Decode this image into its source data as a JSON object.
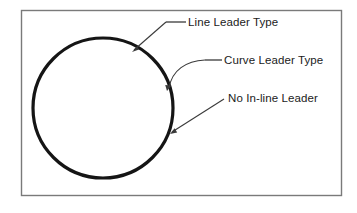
{
  "figure": {
    "name": "leader-type-diagram",
    "background_color": "#ffffff",
    "frame": {
      "name": "diagram-border",
      "stroke_color": "#7a7a7a",
      "x": 21,
      "y": 10,
      "width": 320,
      "height": 185
    },
    "shape": {
      "name": "circle",
      "stroke_color": "#151515",
      "fill": "none",
      "center_x": 103,
      "center_y": 108,
      "radius": 70,
      "stroke_width": 3.2
    },
    "leader_stroke_color": "#3a3a3a",
    "annotations": [
      {
        "id": "line-leader",
        "label": "Line Leader Type",
        "leader_style": "line",
        "text_x": 188,
        "text_y": 26,
        "landing_x1": 166,
        "landing_y1": 22,
        "landing_x2": 186,
        "landing_y2": 22,
        "elbow_x": 166,
        "elbow_y": 22,
        "arrow_x": 132,
        "arrow_y": 52
      },
      {
        "id": "curve-leader",
        "label": "Curve Leader Type",
        "leader_style": "curve",
        "text_x": 224,
        "text_y": 64,
        "landing_x1": 205,
        "landing_y1": 60,
        "landing_x2": 222,
        "landing_y2": 60,
        "curve_cx": 183,
        "curve_cy": 61,
        "arrow_x": 167,
        "arrow_y": 91
      },
      {
        "id": "no-inline-leader",
        "label": "No In-line Leader",
        "leader_style": "none",
        "text_x": 228,
        "text_y": 102,
        "start_x": 224,
        "start_y": 99,
        "arrow_x": 170,
        "arrow_y": 134
      }
    ]
  }
}
